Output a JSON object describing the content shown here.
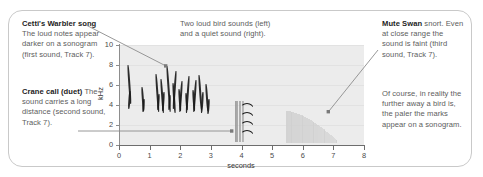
{
  "figure": {
    "frame_color": "#c9c9c9",
    "background": "#ffffff"
  },
  "callouts": {
    "warbler": {
      "title": "Cetti's Warbler song",
      "body": " The loud notes appear darker on a sonogram (first sound, Track 7)."
    },
    "crane": {
      "title": "Crane call (duet)",
      "body": " The sound carries a long distance (second sound, Track 7)."
    },
    "top": {
      "line1": "Two loud bird sounds (left)",
      "line2": "and a quiet sound (right)."
    },
    "swan": {
      "title": "Mute Swan",
      "body": " snort. Even at close range the sound is faint (third sound, Track 7)."
    },
    "swan_note": {
      "body": "Of course, in reality the further away a bird is, the paler the marks appear on a sonogram."
    }
  },
  "chart_data": {
    "type": "heatmap",
    "xlabel": "seconds",
    "ylabel": "kHz",
    "xlim": [
      0,
      8
    ],
    "ylim": [
      0,
      10
    ],
    "xticks": [
      0,
      1,
      2,
      3,
      4,
      5,
      6,
      7,
      8
    ],
    "yticks": [
      0,
      2,
      4,
      6,
      8,
      10
    ],
    "grid": true,
    "plot_background": "#ececec",
    "gridline_color": "#e2e2e2",
    "annotations": [
      {
        "label": "Cetti's Warbler song",
        "target_seconds": 1.55,
        "target_khz": 7.9,
        "darkness": "dark"
      },
      {
        "label": "Crane call (duet)",
        "target_seconds": 3.7,
        "target_khz": 1.5,
        "darkness": "dark"
      },
      {
        "label": "Mute Swan snort",
        "target_seconds": 6.85,
        "target_khz": 3.3,
        "darkness": "pale"
      }
    ],
    "series": [
      {
        "name": "Cetti's Warbler song (first sound)",
        "kind": "vertical-streaks",
        "time_range": [
          0.25,
          2.95
        ],
        "freq_range": [
          3.2,
          8.2
        ],
        "intensity": "loud-dark",
        "marks": [
          {
            "t": 0.27,
            "f_low": 4.1,
            "f_high": 8.0
          },
          {
            "t": 0.33,
            "f_low": 3.6,
            "f_high": 5.4
          },
          {
            "t": 0.72,
            "f_low": 3.4,
            "f_high": 5.8
          },
          {
            "t": 0.78,
            "f_low": 3.3,
            "f_high": 4.6
          },
          {
            "t": 1.18,
            "f_low": 3.3,
            "f_high": 7.1
          },
          {
            "t": 1.26,
            "f_low": 3.5,
            "f_high": 5.1
          },
          {
            "t": 1.35,
            "f_low": 3.2,
            "f_high": 6.6
          },
          {
            "t": 1.44,
            "f_low": 3.4,
            "f_high": 5.3
          },
          {
            "t": 1.52,
            "f_low": 3.3,
            "f_high": 7.9
          },
          {
            "t": 1.62,
            "f_low": 3.5,
            "f_high": 5.0
          },
          {
            "t": 1.72,
            "f_low": 3.2,
            "f_high": 6.2
          },
          {
            "t": 1.84,
            "f_low": 3.6,
            "f_high": 7.4
          },
          {
            "t": 1.94,
            "f_low": 3.4,
            "f_high": 5.6
          },
          {
            "t": 2.04,
            "f_low": 3.3,
            "f_high": 6.4
          },
          {
            "t": 2.15,
            "f_low": 3.5,
            "f_high": 5.2
          },
          {
            "t": 2.26,
            "f_low": 3.2,
            "f_high": 6.9
          },
          {
            "t": 2.37,
            "f_low": 3.4,
            "f_high": 5.5
          },
          {
            "t": 2.48,
            "f_low": 3.3,
            "f_high": 6.5
          },
          {
            "t": 2.59,
            "f_low": 3.5,
            "f_high": 7.0
          },
          {
            "t": 2.7,
            "f_low": 3.2,
            "f_high": 5.3
          },
          {
            "t": 2.82,
            "f_low": 3.4,
            "f_high": 6.1
          },
          {
            "t": 2.92,
            "f_low": 3.1,
            "f_high": 4.6
          }
        ]
      },
      {
        "name": "Crane call duet (second sound)",
        "kind": "harmonic-arcs",
        "time_range": [
          3.72,
          4.45
        ],
        "freq_range": [
          0.4,
          4.4
        ],
        "intensity": "loud-dark",
        "arcs": [
          {
            "t_start": 3.95,
            "t_end": 4.42,
            "f_peak": 4.2
          },
          {
            "t_start": 3.95,
            "t_end": 4.42,
            "f_peak": 3.3
          },
          {
            "t_start": 3.95,
            "t_end": 4.42,
            "f_peak": 2.4
          },
          {
            "t_start": 3.95,
            "t_end": 4.42,
            "f_peak": 1.5
          }
        ],
        "onset_streaks": {
          "t": 3.78,
          "f_low": 0.3,
          "f_high": 4.4,
          "count": 7
        }
      },
      {
        "name": "Mute Swan snort (third sound)",
        "kind": "faint-noise-band",
        "time_range": [
          5.45,
          7.1
        ],
        "freq_range": [
          0.2,
          3.4
        ],
        "intensity": "quiet-pale",
        "pale_color": "#cfcfcf"
      }
    ]
  }
}
